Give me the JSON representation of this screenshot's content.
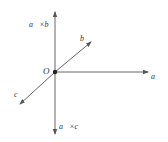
{
  "diagram": {
    "origin_label": "O",
    "vectors": [
      {
        "id": "a",
        "label": "a⃗",
        "direction": "right"
      },
      {
        "id": "b",
        "label": "b⃗",
        "direction": "upper-right"
      },
      {
        "id": "c",
        "label": "c⃗",
        "direction": "lower-left"
      },
      {
        "id": "axb",
        "label": "a⃗×b⃗",
        "direction": "up"
      },
      {
        "id": "axc",
        "label": "a⃗×c⃗",
        "direction": "down"
      }
    ],
    "colors": {
      "stroke": "#555555",
      "origin": "#222222"
    }
  }
}
